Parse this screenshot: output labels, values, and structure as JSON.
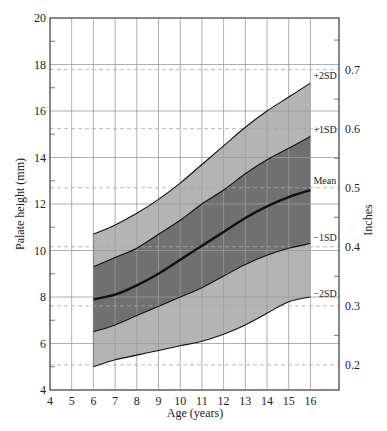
{
  "chart_data": {
    "type": "area",
    "title": "",
    "xlabel": "Age (years)",
    "ylabel": "Palate height (mm)",
    "y2label": "Inches",
    "xlim": [
      4,
      17.3
    ],
    "ylim": [
      4,
      20
    ],
    "x_ticks": [
      4,
      5,
      6,
      7,
      8,
      9,
      10,
      11,
      12,
      13,
      14,
      15,
      16
    ],
    "y_ticks": [
      4,
      6,
      8,
      10,
      12,
      14,
      16,
      18,
      20
    ],
    "y_minor_ticks": [
      5,
      7,
      9,
      11,
      13,
      15,
      17,
      19
    ],
    "y2_ticks": [
      {
        "label": "0.2",
        "inches": 0.2,
        "mm": 5.08
      },
      {
        "label": "0.3",
        "inches": 0.3,
        "mm": 7.62
      },
      {
        "label": "0.4",
        "inches": 0.4,
        "mm": 10.16
      },
      {
        "label": "0.5",
        "inches": 0.5,
        "mm": 12.7
      },
      {
        "label": "0.6",
        "inches": 0.6,
        "mm": 15.24
      },
      {
        "label": "0.7",
        "inches": 0.7,
        "mm": 17.78
      }
    ],
    "y2_minor_ticks_mm": [
      6.35,
      8.89,
      11.43,
      13.97,
      16.51,
      19.05
    ],
    "grid": true,
    "inch_gridlines_dashed": true,
    "x": [
      6,
      7,
      8,
      9,
      10,
      11,
      12,
      13,
      14,
      15,
      16
    ],
    "series": [
      {
        "name": "+2SD",
        "values": [
          10.7,
          11.1,
          11.6,
          12.2,
          12.9,
          13.7,
          14.5,
          15.3,
          16.0,
          16.6,
          17.2
        ]
      },
      {
        "name": "+1SD",
        "values": [
          9.3,
          9.7,
          10.1,
          10.7,
          11.3,
          12.0,
          12.6,
          13.3,
          13.9,
          14.4,
          14.9
        ]
      },
      {
        "name": "Mean",
        "values": [
          7.9,
          8.1,
          8.5,
          9.0,
          9.6,
          10.2,
          10.8,
          11.4,
          11.9,
          12.3,
          12.6
        ]
      },
      {
        "name": "-1SD",
        "values": [
          6.5,
          6.8,
          7.2,
          7.6,
          8.0,
          8.4,
          8.9,
          9.4,
          9.8,
          10.1,
          10.3
        ]
      },
      {
        "name": "-2SD",
        "values": [
          5.0,
          5.3,
          5.5,
          5.7,
          5.9,
          6.1,
          6.4,
          6.8,
          7.3,
          7.8,
          8.0
        ]
      }
    ],
    "band_labels": [
      "+2SD",
      "+1SD",
      "Mean",
      "−1SD",
      "−2SD"
    ],
    "colors": {
      "outer_band": "#b4b4b4",
      "inner_band": "#707070",
      "mean_line": "#111111",
      "grid": "#9a9a9a",
      "dashed_grid": "#a8a8a8",
      "axis": "#555555"
    }
  }
}
